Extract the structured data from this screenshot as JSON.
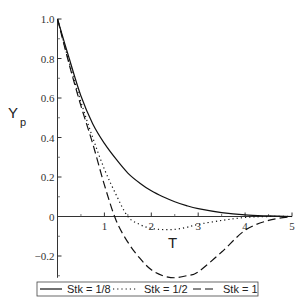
{
  "chart_data": {
    "type": "line",
    "title": "",
    "xlabel": "T",
    "ylabel": "Y",
    "ylabel_subscript": "p",
    "xlim": [
      0,
      5
    ],
    "ylim": [
      -0.3,
      1.0
    ],
    "grid": false,
    "x_ticks": [
      1,
      2,
      3,
      4,
      5
    ],
    "x_tick_labels": [
      "1",
      "2",
      "3",
      "4",
      "5"
    ],
    "y_ticks": [
      -0.2,
      0,
      0.2,
      0.4,
      0.6,
      0.8,
      1.0
    ],
    "y_tick_labels": [
      "−0.2",
      "0",
      "0.2",
      "0.4",
      "0.6",
      "0.8",
      "1.0"
    ],
    "legend_placement": "bottom",
    "x": [
      0,
      0.25,
      0.5,
      0.75,
      1,
      1.25,
      1.5,
      1.75,
      2,
      2.25,
      2.5,
      2.75,
      3,
      3.5,
      4,
      4.5,
      5
    ],
    "series": [
      {
        "name": "Stk = 1/8",
        "style": "solid",
        "values": [
          1.0,
          0.8,
          0.61,
          0.47,
          0.37,
          0.29,
          0.22,
          0.17,
          0.13,
          0.1,
          0.075,
          0.055,
          0.04,
          0.02,
          0.008,
          0.003,
          0.0
        ]
      },
      {
        "name": "Stk = 1/2",
        "style": "dotted",
        "values": [
          1.0,
          0.78,
          0.58,
          0.4,
          0.24,
          0.11,
          0.0,
          -0.04,
          -0.06,
          -0.066,
          -0.065,
          -0.055,
          -0.04,
          -0.02,
          -0.005,
          0.0,
          0.0
        ]
      },
      {
        "name": "Stk = 1",
        "style": "dashed",
        "values": [
          1.0,
          0.77,
          0.56,
          0.37,
          0.16,
          -0.02,
          -0.13,
          -0.21,
          -0.27,
          -0.3,
          -0.31,
          -0.3,
          -0.28,
          -0.18,
          -0.07,
          -0.02,
          0.0
        ]
      }
    ]
  },
  "legend": {
    "items": [
      "Stk = 1/8",
      "Stk = 1/2",
      "Stk = 1"
    ]
  }
}
